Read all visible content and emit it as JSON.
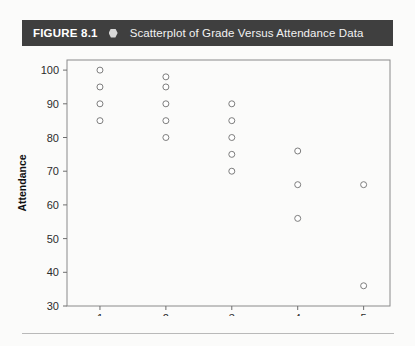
{
  "figure": {
    "label": "FIGURE 8.1",
    "bullet_icon": "hexagon-bullet-icon",
    "title": "Scatterplot of Grade Versus Attendance Data",
    "bar_color": "#3f3f3f",
    "bar_text_color": "#ffffff"
  },
  "chart_data": {
    "type": "scatter",
    "title": "Scatterplot of Grade Versus Attendance Data",
    "xlabel": "Grade",
    "ylabel": "Attendance",
    "xlim": [
      0.5,
      5.4
    ],
    "ylim": [
      30,
      103
    ],
    "xticks": [
      1,
      2,
      3,
      4,
      5
    ],
    "xtick_labels": [
      "1",
      "2",
      "3",
      "4",
      "5"
    ],
    "yticks": [
      30,
      40,
      50,
      60,
      70,
      80,
      90,
      100
    ],
    "ytick_labels": [
      "30",
      "40",
      "50",
      "60",
      "70",
      "80",
      "90",
      "100"
    ],
    "grid": false,
    "legend": null,
    "marker": {
      "shape": "open-circle",
      "fill": "#ffffff",
      "edge_color": "#7d7d7d",
      "radius_px": 3
    },
    "points": [
      {
        "x": 1,
        "y": 100
      },
      {
        "x": 1,
        "y": 95
      },
      {
        "x": 1,
        "y": 90
      },
      {
        "x": 1,
        "y": 85
      },
      {
        "x": 2,
        "y": 98
      },
      {
        "x": 2,
        "y": 95
      },
      {
        "x": 2,
        "y": 90
      },
      {
        "x": 2,
        "y": 85
      },
      {
        "x": 2,
        "y": 80
      },
      {
        "x": 3,
        "y": 90
      },
      {
        "x": 3,
        "y": 85
      },
      {
        "x": 3,
        "y": 80
      },
      {
        "x": 3,
        "y": 75
      },
      {
        "x": 3,
        "y": 70
      },
      {
        "x": 4,
        "y": 76
      },
      {
        "x": 4,
        "y": 66
      },
      {
        "x": 4,
        "y": 56
      },
      {
        "x": 5,
        "y": 66
      },
      {
        "x": 5,
        "y": 36
      }
    ]
  }
}
